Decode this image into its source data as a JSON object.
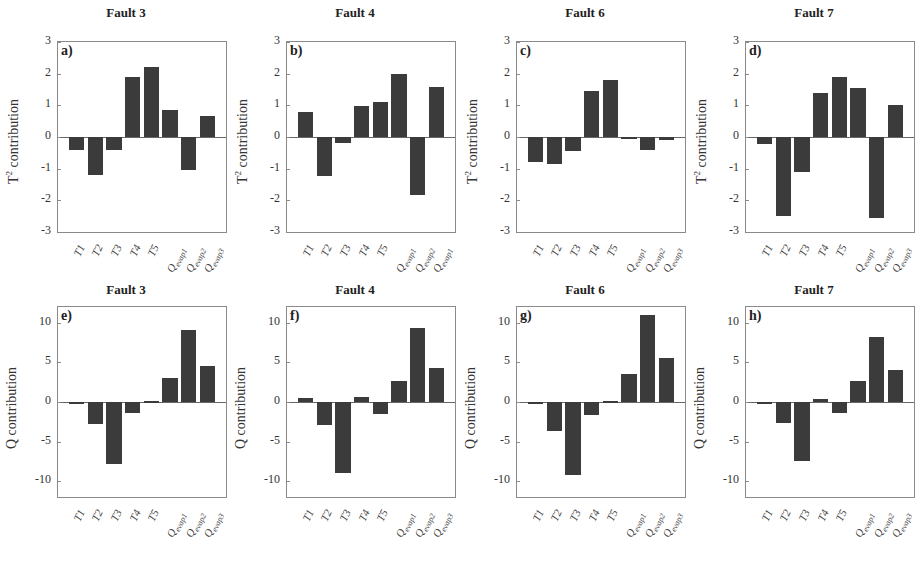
{
  "chart_data": [
    {
      "id": "a",
      "type": "bar",
      "title": "Fault 3",
      "panel_label": "a)",
      "ylabel": "T2 contribution",
      "ylim": [
        -3,
        3
      ],
      "yticks": [
        3,
        2,
        1,
        0,
        -1,
        -2,
        -3
      ],
      "categories": [
        "T1",
        "T2",
        "T3",
        "T4",
        "T5",
        "Qevap1",
        "Qevap2",
        "Qevap3"
      ],
      "values": [
        -0.4,
        -1.2,
        -0.4,
        1.9,
        2.2,
        0.85,
        -1.05,
        0.65
      ]
    },
    {
      "id": "b",
      "type": "bar",
      "title": "Fault 4",
      "panel_label": "b)",
      "ylabel": "T2 contribution",
      "ylim": [
        -3,
        3
      ],
      "yticks": [
        3,
        2,
        1,
        0,
        -1,
        -2,
        -3
      ],
      "categories": [
        "T1",
        "T2",
        "T3",
        "T4",
        "T5",
        "Qevap1",
        "Qevap2",
        "Qevap1"
      ],
      "values": [
        0.78,
        -1.22,
        -0.18,
        0.97,
        1.1,
        1.98,
        -1.82,
        1.58
      ]
    },
    {
      "id": "c",
      "type": "bar",
      "title": "Fault 6",
      "panel_label": "c)",
      "ylabel": "T2 contribution",
      "ylim": [
        -3,
        3
      ],
      "yticks": [
        3,
        2,
        1,
        0,
        -1,
        -2,
        -3
      ],
      "categories": [
        "T1",
        "T2",
        "T3",
        "T4",
        "T5",
        "Qevap1",
        "Qevap2",
        "Qevap3"
      ],
      "values": [
        -0.8,
        -0.85,
        -0.45,
        1.45,
        1.8,
        -0.05,
        -0.4,
        -0.1
      ]
    },
    {
      "id": "d",
      "type": "bar",
      "title": "Fault 7",
      "panel_label": "d)",
      "ylabel": "T2 contribution",
      "ylim": [
        -3,
        3
      ],
      "yticks": [
        3,
        2,
        1,
        0,
        -1,
        -2,
        -3
      ],
      "categories": [
        "T1",
        "T2",
        "T3",
        "T4",
        "T5",
        "Qevap1",
        "Qevap2",
        "Qevap3"
      ],
      "values": [
        -0.22,
        -2.5,
        -1.1,
        1.38,
        1.9,
        1.55,
        -2.55,
        1.02
      ]
    },
    {
      "id": "e",
      "type": "bar",
      "title": "Fault 3",
      "panel_label": "e)",
      "ylabel": "Q contribution",
      "ylim": [
        -12,
        12
      ],
      "yticks": [
        10,
        5,
        0,
        -5,
        -10
      ],
      "categories": [
        "T1",
        "T2",
        "T3",
        "T4",
        "T5",
        "Qevap1",
        "Qevap2",
        "Qevap3"
      ],
      "values": [
        -0.3,
        -2.8,
        -7.8,
        -1.4,
        0.1,
        3.0,
        9.1,
        4.5
      ]
    },
    {
      "id": "f",
      "type": "bar",
      "title": "Fault 4",
      "panel_label": "f)",
      "ylabel": "Q contribution",
      "ylim": [
        -12,
        12
      ],
      "yticks": [
        10,
        5,
        0,
        -5,
        -10
      ],
      "categories": [
        "T1",
        "T2",
        "T3",
        "T4",
        "T5",
        "Qevap1",
        "Qevap2",
        "Qevap3"
      ],
      "values": [
        0.5,
        -2.9,
        -9.0,
        0.6,
        -1.5,
        2.7,
        9.3,
        4.3
      ]
    },
    {
      "id": "g",
      "type": "bar",
      "title": "Fault 6",
      "panel_label": "g)",
      "ylabel": "Q contribution",
      "ylim": [
        -12,
        12
      ],
      "yticks": [
        10,
        5,
        0,
        -5,
        -10
      ],
      "categories": [
        "T1",
        "T2",
        "T3",
        "T4",
        "T5",
        "Qevap1",
        "Qevap2",
        "Qevap3"
      ],
      "values": [
        -0.3,
        -3.6,
        -9.2,
        -1.7,
        0.1,
        3.5,
        11.0,
        5.5
      ]
    },
    {
      "id": "h",
      "type": "bar",
      "title": "Fault 7",
      "panel_label": "h)",
      "ylabel": "Q contribution",
      "ylim": [
        -12,
        12
      ],
      "yticks": [
        10,
        5,
        0,
        -5,
        -10
      ],
      "categories": [
        "T1",
        "T2",
        "T3",
        "T4",
        "T5",
        "Qevap1",
        "Qevap2",
        "Qevap3"
      ],
      "values": [
        -0.2,
        -2.6,
        -7.5,
        0.4,
        -1.4,
        2.6,
        8.2,
        4.0
      ]
    }
  ],
  "layout": {
    "grid": "2x4",
    "bar_color": "#3b3b3b",
    "grid_lines": false,
    "legend": "none"
  }
}
